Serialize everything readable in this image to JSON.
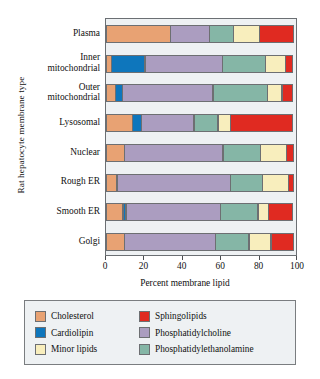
{
  "chart_data": {
    "type": "bar",
    "orientation": "horizontal",
    "stacked": true,
    "title": "",
    "xlabel": "Percent membrane lipid",
    "ylabel": "Rat hepatocyte membrane type",
    "xlim": [
      0,
      100
    ],
    "xticks": [
      0,
      20,
      40,
      60,
      80,
      100
    ],
    "xticklabels": [
      "0",
      "20",
      "40",
      "60",
      "80",
      "100"
    ],
    "grid": false,
    "legend_position": "below",
    "categories": [
      "Plasma",
      "Inner mitochondrial",
      "Outer mitochondrial",
      "Lysosomal",
      "Nuclear",
      "Rough ER",
      "Smooth ER",
      "Golgi"
    ],
    "category_label_lines": [
      [
        "Plasma"
      ],
      [
        "Inner",
        "mitochondrial"
      ],
      [
        "Outer",
        "mitochondrial"
      ],
      [
        "Lysosomal"
      ],
      [
        "Nuclear"
      ],
      [
        "Rough ER"
      ],
      [
        "Smooth ER"
      ],
      [
        "Golgi"
      ]
    ],
    "series": [
      {
        "name": "Cholesterol",
        "color": "#e8a273",
        "values": [
          34,
          3,
          5,
          14,
          10,
          6,
          9,
          10
        ]
      },
      {
        "name": "Cardiolipin",
        "color": "#0e76bc",
        "values": [
          0,
          18,
          4,
          5,
          0,
          0,
          2,
          0
        ]
      },
      {
        "name": "Phosphatidylcholine",
        "color": "#ab9dc0",
        "values": [
          21,
          41,
          48,
          28,
          52,
          60,
          50,
          48
        ]
      },
      {
        "name": "Phosphatidylethanolamine",
        "color": "#85b6a6",
        "values": [
          13,
          23,
          29,
          13,
          20,
          17,
          20,
          18
        ]
      },
      {
        "name": "Minor lipids",
        "color": "#f8eebd",
        "values": [
          14,
          11,
          8,
          7,
          14,
          14,
          6,
          12
        ]
      },
      {
        "name": "Sphingolipids",
        "color": "#e02a21",
        "values": [
          18,
          4,
          6,
          33,
          4,
          3,
          13,
          12
        ]
      }
    ],
    "legend_entries": [
      {
        "label": "Cholesterol",
        "color": "#e8a273"
      },
      {
        "label": "Sphingolipids",
        "color": "#e02a21"
      },
      {
        "label": "Cardiolipin",
        "color": "#0e76bc"
      },
      {
        "label": "Phosphatidylcholine",
        "color": "#ab9dc0"
      },
      {
        "label": "Minor lipids",
        "color": "#f8eebd"
      },
      {
        "label": "Phosphatidylethanolamine",
        "color": "#85b6a6"
      }
    ],
    "colors": {
      "cholesterol": "#e8a273",
      "cardiolipin": "#0e76bc",
      "phosphatidylcholine": "#ab9dc0",
      "phosphatidylethanolamine": "#85b6a6",
      "minor_lipids": "#f8eebd",
      "sphingolipids": "#e02a21",
      "panel_background": "#eef1f3",
      "panel_border": "#6b6f73"
    }
  }
}
